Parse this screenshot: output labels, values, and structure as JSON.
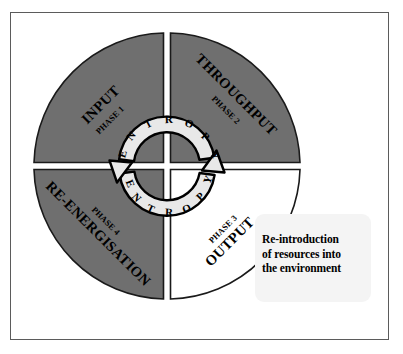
{
  "diagram": {
    "colors": {
      "quadrant_filled": "#6f6f6f",
      "quadrant_empty": "#ffffff",
      "outline": "#000000",
      "band_fill": "#e8e8e8",
      "frame_border": "#5b5b5b",
      "callout_fill": "#f4f4f4"
    },
    "quadrants": [
      {
        "id": "top-left",
        "name": "INPUT",
        "phase": "PHASE 1",
        "fill": "gray",
        "rotation_deg": -45
      },
      {
        "id": "top-right",
        "name": "THROUGHPUT",
        "phase": "PHASE 2",
        "fill": "gray",
        "rotation_deg": 45
      },
      {
        "id": "bottom-right",
        "name": "OUTPUT",
        "phase": "PHASE 3",
        "fill": "white",
        "rotation_deg": -45
      },
      {
        "id": "bottom-left",
        "name": "RE-ENERGISATION",
        "phase": "PHASE 4",
        "fill": "gray",
        "rotation_deg": 45
      }
    ],
    "arcs": [
      {
        "id": "upper-entropy-arc",
        "label": "ENTROPY",
        "letters": [
          "E",
          "N",
          "T",
          "R",
          "O",
          "P",
          "Y"
        ],
        "opens": "downward",
        "arrow_end": "right"
      },
      {
        "id": "lower-entropy-arc",
        "label": "ENTROPY",
        "letters": [
          "E",
          "N",
          "T",
          "R",
          "O",
          "P",
          "Y"
        ],
        "opens": "upward",
        "arrow_end": "left"
      }
    ],
    "callout": {
      "name": "re-introduction-callout",
      "lines": [
        "Re-introduction",
        "of resources into",
        "the environment"
      ]
    }
  }
}
